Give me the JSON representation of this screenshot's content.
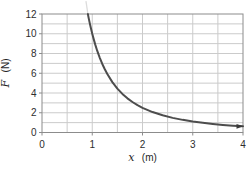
{
  "chart_data": {
    "type": "line",
    "title": "",
    "xlabel": "x (m)",
    "ylabel": "F (N)",
    "xlabel_var": "x",
    "xlabel_unit": "(m)",
    "ylabel_var": "F",
    "ylabel_unit": "(N)",
    "xlim": [
      0,
      4
    ],
    "ylim": [
      0,
      12
    ],
    "x_major_ticks": [
      0,
      1,
      2,
      3,
      4
    ],
    "y_major_ticks": [
      0,
      2,
      4,
      6,
      8,
      10,
      12
    ],
    "x_minor_step": 0.5,
    "y_minor_step": 1,
    "grid": true,
    "legend": false,
    "relationship": "F = 10 / x^2 (inverse-square decay curve, clipped at top of plot)",
    "series": [
      {
        "name": "inverse-square force curve",
        "color": "#4d4d4d",
        "points": [
          [
            0.913,
            12.0
          ],
          [
            0.93,
            11.56
          ],
          [
            0.95,
            11.08
          ],
          [
            0.97,
            10.63
          ],
          [
            1.0,
            10.0
          ],
          [
            1.03,
            9.43
          ],
          [
            1.06,
            8.9
          ],
          [
            1.1,
            8.26
          ],
          [
            1.15,
            7.56
          ],
          [
            1.2,
            6.94
          ],
          [
            1.25,
            6.4
          ],
          [
            1.3,
            5.92
          ],
          [
            1.4,
            5.1
          ],
          [
            1.5,
            4.44
          ],
          [
            1.6,
            3.91
          ],
          [
            1.7,
            3.46
          ],
          [
            1.8,
            3.09
          ],
          [
            1.9,
            2.77
          ],
          [
            2.0,
            2.5
          ],
          [
            2.2,
            2.07
          ],
          [
            2.4,
            1.74
          ],
          [
            2.6,
            1.48
          ],
          [
            2.8,
            1.28
          ],
          [
            3.0,
            1.11
          ],
          [
            3.2,
            0.98
          ],
          [
            3.4,
            0.87
          ],
          [
            3.6,
            0.77
          ],
          [
            3.8,
            0.69
          ],
          [
            4.0,
            0.63
          ]
        ]
      }
    ],
    "curve_extension_above_top": {
      "color": "#dcdcdc",
      "points": [
        [
          0.875,
          13.3
        ],
        [
          0.913,
          12.0
        ]
      ]
    },
    "arrowhead_at_end": true,
    "colors": {
      "grid": "#cbcbcb",
      "axis": "#8c8c8c",
      "tick_label": "#2e2e2e",
      "curve": "#4d4d4d",
      "arrow": "#3a3a3a",
      "background": "#ffffff"
    }
  }
}
